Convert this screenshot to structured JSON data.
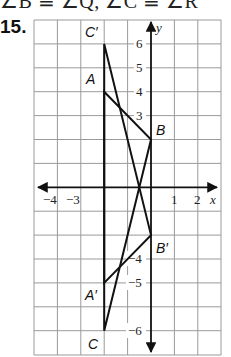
{
  "header": {
    "cropped_text": "∠B ≅ ∠Q, ∠C ≅ ∠R",
    "problem_number": "15."
  },
  "graph": {
    "x_axis_label": "x",
    "y_axis_label": "y",
    "x_tick_labels": [
      {
        "value": -4,
        "text": "−4"
      },
      {
        "value": -3,
        "text": "−3"
      },
      {
        "value": 1,
        "text": "1"
      },
      {
        "value": 2,
        "text": "2"
      }
    ],
    "y_tick_labels": [
      {
        "value": 6,
        "text": "6"
      },
      {
        "value": 5,
        "text": "5"
      },
      {
        "value": 4,
        "text": "4"
      },
      {
        "value": 3,
        "text": "3"
      },
      {
        "value": -4,
        "text": "−4"
      },
      {
        "value": -5,
        "text": "−5"
      },
      {
        "value": -6,
        "text": "−6"
      }
    ],
    "x_range": [
      -5,
      3
    ],
    "y_range": [
      -7,
      7
    ],
    "grid": true,
    "colors": {
      "grid": "#9a9a9a",
      "axis": "#111111",
      "lines": "#111111"
    }
  },
  "triangles": [
    {
      "name": "ABC",
      "vertices": [
        {
          "label": "A",
          "x": -2,
          "y": 4
        },
        {
          "label": "B",
          "x": 0,
          "y": 2
        },
        {
          "label": "C",
          "x": -2,
          "y": -6
        }
      ]
    },
    {
      "name": "A'B'C'",
      "vertices": [
        {
          "label": "A′",
          "x": -2,
          "y": -4
        },
        {
          "label": "B′",
          "x": 0,
          "y": -2
        },
        {
          "label": "C′",
          "x": -2,
          "y": 6
        }
      ]
    }
  ],
  "labels": {
    "A": "A",
    "B": "B",
    "C": "C",
    "A_prime": "A′",
    "B_prime": "B′",
    "C_prime": "C′"
  }
}
